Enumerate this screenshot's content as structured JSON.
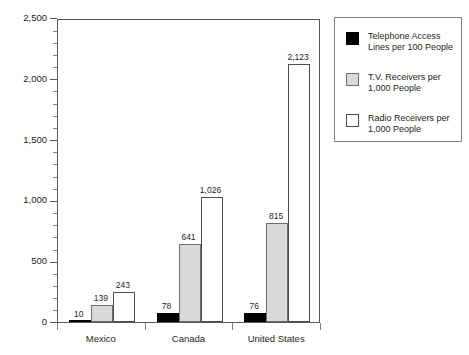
{
  "chart_data": {
    "type": "bar",
    "title": "",
    "xlabel": "",
    "ylabel": "",
    "ylim": [
      0,
      2500
    ],
    "ytick_labels": [
      "0",
      "500",
      "1,000",
      "1,500",
      "2,000",
      "2,500"
    ],
    "ytick_values": [
      0,
      500,
      1000,
      1500,
      2000,
      2500
    ],
    "minor_tick_interval": 100,
    "grid": false,
    "legend_position": "right",
    "categories": [
      "Mexico",
      "Canada",
      "United States"
    ],
    "series": [
      {
        "name": "Telephone Access Lines per 100 People",
        "key": "telephone",
        "color": "#000000",
        "values": [
          10,
          78,
          76
        ],
        "value_labels": [
          "10",
          "78",
          "76"
        ]
      },
      {
        "name": "T.V. Receivers per 1,000 People",
        "key": "tv",
        "color": "#d9d9d9",
        "values": [
          139,
          641,
          815
        ],
        "value_labels": [
          "139",
          "641",
          "815"
        ]
      },
      {
        "name": "Radio Receivers per 1,000 People",
        "key": "radio",
        "color": "#ffffff",
        "values": [
          243,
          1026,
          2123
        ],
        "value_labels": [
          "243",
          "1,026",
          "2,123"
        ]
      }
    ]
  },
  "legend": {
    "items": [
      {
        "label": "Telephone Access\nLines per 100 People",
        "swatch": "telephone"
      },
      {
        "label": "T.V. Receivers per\n1,000 People",
        "swatch": "tv"
      },
      {
        "label": "Radio Receivers per\n1,000 People",
        "swatch": "radio"
      }
    ]
  },
  "axis": {
    "max": 2500,
    "min": 0
  }
}
